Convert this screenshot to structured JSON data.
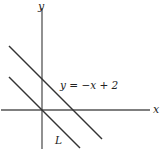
{
  "diagram": {
    "axes": {
      "x_label": "x",
      "y_label": "y"
    },
    "lines": [
      {
        "name": "line-y-eq-neg-x-plus-2",
        "label": "y = −x + 2",
        "slope": -1,
        "intercept": 2
      },
      {
        "name": "line-L",
        "label": "L",
        "slope": -1,
        "intercept": 0
      }
    ],
    "colors": {
      "stroke": "#333333",
      "text": "#222222"
    }
  }
}
